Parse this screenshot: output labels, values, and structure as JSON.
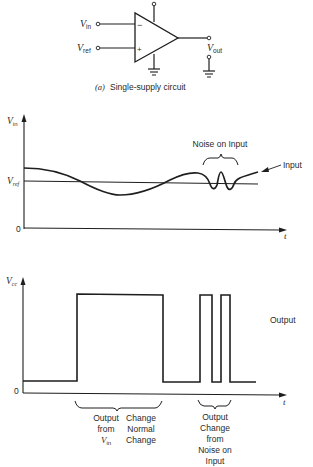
{
  "circuit": {
    "input_inverting_label": "V",
    "input_inverting_sub": "in",
    "input_noninverting_label": "V",
    "input_noninverting_sub": "ref",
    "minus_sign": "−",
    "plus_sign": "+",
    "output_label": "V",
    "output_sub": "out",
    "caption_prefix": "(a)",
    "caption": "Single-supply circuit"
  },
  "input_chart": {
    "y_axis_label": "V",
    "y_axis_sub": "in",
    "ref_label": "V",
    "ref_sub": "ref",
    "zero_label": "0",
    "x_axis_label": "t",
    "noise_label": "Noise on Input",
    "signal_label": "Input"
  },
  "output_chart": {
    "y_axis_label": "V",
    "y_axis_sub": "cc",
    "zero_label": "0",
    "x_axis_label": "t",
    "signal_label": "Output",
    "annotation_normal": {
      "col1": [
        "Output",
        "from",
        "V"
      ],
      "col1_sub": "in",
      "col2": [
        "Change",
        "Normal",
        "Change"
      ]
    },
    "annotation_noise": [
      "Output",
      "Change",
      "from",
      "Noise on",
      "Input"
    ]
  },
  "colors": {
    "ink": "#1e1e1e",
    "background": "#ffffff"
  }
}
